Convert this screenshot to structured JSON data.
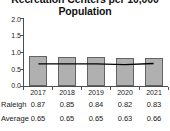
{
  "chart_data": {
    "type": "bar",
    "title": "Recreation Centers per 10,000 Population",
    "title_lines": [
      "Recreation Centers per 10,000",
      "Population"
    ],
    "xlabel": "",
    "ylabel": "",
    "categories": [
      "2017",
      "2018",
      "2019",
      "2020",
      "2021"
    ],
    "ylim": [
      0.0,
      2.0
    ],
    "yticks": [
      "2.0",
      "1.5",
      "1.0",
      "0.5",
      "0.0"
    ],
    "ytick_values": [
      2.0,
      1.5,
      1.0,
      0.5,
      0.0
    ],
    "grid": false,
    "legend_position": "none",
    "series": [
      {
        "name": "Raleigh",
        "type": "bar",
        "values": [
          0.87,
          0.85,
          0.84,
          0.82,
          0.83
        ],
        "labels": [
          "0.87",
          "0.85",
          "0.84",
          "0.82",
          "0.83"
        ],
        "fill_color": "#b0b0b0",
        "edge_color": "#636363"
      },
      {
        "name": "Average",
        "type": "line",
        "values": [
          0.65,
          0.65,
          0.65,
          0.63,
          0.66
        ],
        "labels": [
          "0.65",
          "0.65",
          "0.65",
          "0.63",
          "0.66"
        ],
        "line_color": "#000000"
      }
    ],
    "table": {
      "row_headers": [
        "Raleigh",
        "Average"
      ],
      "column_headers": [
        "2017",
        "2018",
        "2019",
        "2020",
        "2021"
      ],
      "rows": [
        [
          "0.87",
          "0.85",
          "0.84",
          "0.82",
          "0.83"
        ],
        [
          "0.65",
          "0.65",
          "0.65",
          "0.63",
          "0.66"
        ]
      ]
    }
  }
}
